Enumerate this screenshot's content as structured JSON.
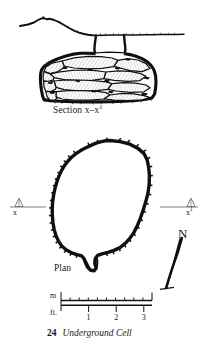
{
  "plate": {
    "background_color": "#ffffff",
    "ink_color": "#111111",
    "figure_number": "24",
    "figure_title": "Underground Cell",
    "type": "archaeological-drawing-plate"
  },
  "section": {
    "caption_text": "Section x–x",
    "caption_superscript": "1",
    "description": "Cross-section of a corbelled dry-stone underground cell showing ground surface line and stacked stone courses",
    "ground_line_label": "ground-surface"
  },
  "plan": {
    "caption_text": "Plan",
    "description": "Oval plan outline of the underground cell with entrance notch at bottom"
  },
  "section_markers": {
    "left": {
      "label": "x",
      "superscript": ""
    },
    "right": {
      "label": "x",
      "superscript": "1"
    }
  },
  "north_arrow": {
    "label": "N"
  },
  "scale_bar": {
    "units": [
      {
        "name": "metres",
        "label": "m"
      },
      {
        "name": "feet",
        "label": "ft."
      }
    ],
    "feet_ticks": [
      {
        "label": "1",
        "value": 1
      },
      {
        "label": "2",
        "value": 2
      },
      {
        "label": "3",
        "value": 3
      }
    ],
    "metre_ticks": [
      0,
      1
    ],
    "metre_subdivisions": 10,
    "length_feet": 3.3,
    "length_metres": 1
  }
}
